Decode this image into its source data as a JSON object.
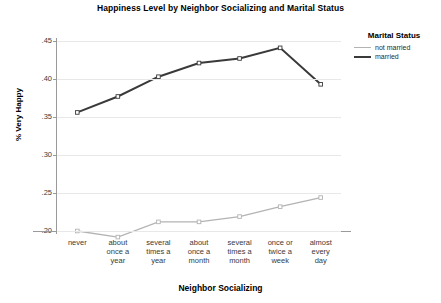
{
  "chart_data": {
    "type": "line",
    "title": "Happiness Level by Neighbor Socializing and Marital Status",
    "xlabel": "Neighbor Socializing",
    "ylabel": "% Very Happy",
    "categories": [
      "never",
      "about once a year",
      "several times a year",
      "about once a month",
      "several times a month",
      "once or twice a week",
      "almost every day"
    ],
    "category_lines": [
      [
        "never"
      ],
      [
        "about",
        "once a",
        "year"
      ],
      [
        "several",
        "times a",
        "year"
      ],
      [
        "about",
        "once a",
        "month"
      ],
      [
        "several",
        "times a",
        "month"
      ],
      [
        "once or",
        "twice a",
        "week"
      ],
      [
        "almost",
        "every",
        "day"
      ]
    ],
    "series": [
      {
        "name": "not married",
        "color": "#b3b3b3",
        "width": 1.3,
        "values": [
          0.2,
          0.192,
          0.212,
          0.212,
          0.219,
          0.232,
          0.244
        ]
      },
      {
        "name": "married",
        "color": "#3a3a3a",
        "width": 2.0,
        "values": [
          0.356,
          0.377,
          0.403,
          0.421,
          0.427,
          0.441,
          0.393
        ]
      }
    ],
    "ylim": [
      0.2,
      0.45
    ],
    "yticks": [
      0.45,
      0.4,
      0.35,
      0.3,
      0.25,
      0.2
    ],
    "ytick_labels": [
      ".45",
      ".40",
      ".35",
      ".30",
      ".25",
      ".20"
    ],
    "grid": true,
    "legend_position": "right",
    "legend_title": "Marital Status"
  }
}
